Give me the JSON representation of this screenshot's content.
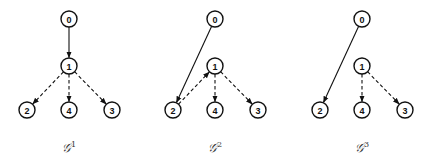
{
  "graphs": [
    {
      "label": "𝒢",
      "superscript": "1",
      "nodes": [
        "0",
        "1",
        "2",
        "4",
        "3"
      ],
      "edges": [
        {
          "from": "0",
          "to": "1",
          "style": "solid"
        },
        {
          "from": "1",
          "to": "2",
          "style": "dashed"
        },
        {
          "from": "1",
          "to": "4",
          "style": "dashed"
        },
        {
          "from": "1",
          "to": "3",
          "style": "dashed"
        }
      ]
    },
    {
      "label": "𝒢",
      "superscript": "2",
      "nodes": [
        "0",
        "1",
        "2",
        "4",
        "3"
      ],
      "edges": [
        {
          "from": "0",
          "to": "2",
          "style": "solid"
        },
        {
          "from": "2",
          "to": "1",
          "style": "dashed"
        },
        {
          "from": "1",
          "to": "4",
          "style": "dashed"
        },
        {
          "from": "1",
          "to": "3",
          "style": "dashed"
        }
      ]
    },
    {
      "label": "𝒢",
      "superscript": "3",
      "nodes": [
        "0",
        "1",
        "2",
        "4",
        "3"
      ],
      "edges": [
        {
          "from": "0",
          "to": "2",
          "style": "solid"
        },
        {
          "from": "1",
          "to": "4",
          "style": "dashed"
        },
        {
          "from": "1",
          "to": "3",
          "style": "dashed"
        }
      ]
    }
  ]
}
